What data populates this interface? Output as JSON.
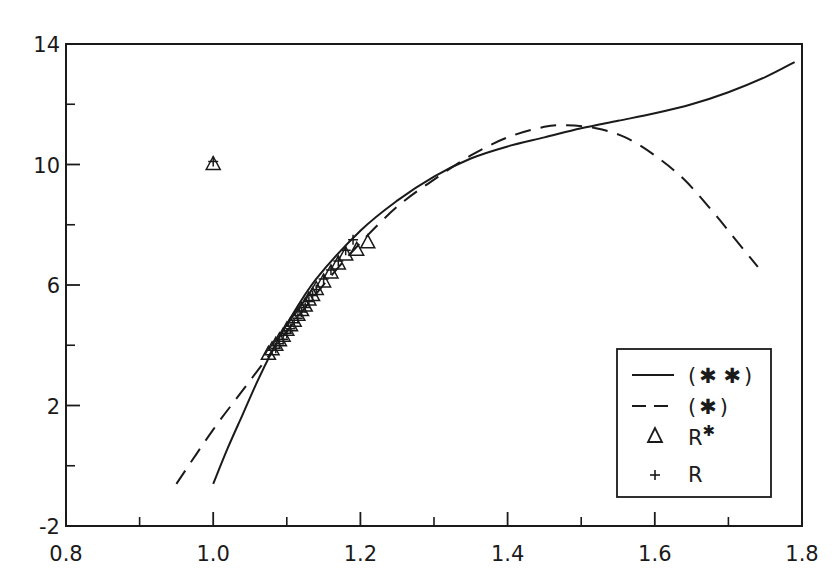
{
  "chart_data": {
    "type": "line",
    "title": "",
    "xlabel": "",
    "ylabel": "",
    "xlim": [
      0.8,
      1.8
    ],
    "ylim": [
      -2,
      14
    ],
    "grid": false,
    "legend_position": "lower right",
    "x_ticks_major": [
      0.8,
      1.0,
      1.2,
      1.4,
      1.6,
      1.8
    ],
    "x_tick_labels": [
      "0.8",
      "1.0",
      "1.2",
      "1.4",
      "1.6",
      "1.8"
    ],
    "x_ticks_minor": [
      0.9,
      1.1,
      1.3,
      1.5,
      1.7
    ],
    "y_ticks_major": [
      -2,
      2,
      6,
      10,
      14
    ],
    "y_tick_labels": [
      "-2",
      "2",
      "6",
      "10",
      "14"
    ],
    "y_ticks_minor": [
      0,
      4,
      8,
      12
    ],
    "series": [
      {
        "name": "(✱✱)",
        "style": "solid",
        "x": [
          1.0,
          1.02,
          1.04,
          1.06,
          1.08,
          1.1,
          1.14,
          1.2,
          1.25,
          1.3,
          1.35,
          1.4,
          1.45,
          1.5,
          1.55,
          1.6,
          1.65,
          1.7,
          1.75,
          1.79
        ],
        "y": [
          -0.6,
          0.6,
          1.7,
          2.8,
          3.8,
          4.7,
          6.2,
          7.8,
          8.8,
          9.6,
          10.2,
          10.6,
          10.9,
          11.2,
          11.45,
          11.7,
          12.0,
          12.4,
          12.9,
          13.4
        ]
      },
      {
        "name": "(✱)",
        "style": "dashed",
        "x": [
          0.95,
          1.0,
          1.04,
          1.08,
          1.12,
          1.16,
          1.2,
          1.25,
          1.3,
          1.35,
          1.4,
          1.45,
          1.48,
          1.52,
          1.56,
          1.6,
          1.64,
          1.68,
          1.71,
          1.74
        ],
        "y": [
          -0.6,
          1.2,
          2.5,
          3.8,
          5.1,
          6.3,
          7.4,
          8.6,
          9.5,
          10.3,
          10.9,
          11.25,
          11.3,
          11.2,
          10.9,
          10.3,
          9.5,
          8.4,
          7.5,
          6.6
        ]
      },
      {
        "name": "R✱",
        "style": "triangle-markers",
        "x": [
          1.0,
          1.075,
          1.08,
          1.085,
          1.09,
          1.095,
          1.1,
          1.105,
          1.11,
          1.115,
          1.12,
          1.125,
          1.13,
          1.135,
          1.14,
          1.15,
          1.16,
          1.17,
          1.18,
          1.195,
          1.21
        ],
        "y": [
          10.0,
          3.7,
          3.85,
          4.0,
          4.15,
          4.3,
          4.5,
          4.65,
          4.8,
          5.0,
          5.15,
          5.3,
          5.5,
          5.65,
          5.85,
          6.1,
          6.4,
          6.7,
          7.0,
          7.15,
          7.4
        ]
      },
      {
        "name": "R",
        "style": "plus-markers",
        "x": [
          1.0,
          1.085,
          1.09,
          1.095,
          1.1,
          1.105,
          1.11,
          1.115,
          1.12,
          1.125,
          1.13,
          1.135,
          1.14,
          1.15,
          1.16,
          1.17,
          1.18,
          1.19
        ],
        "y": [
          10.1,
          3.9,
          4.05,
          4.2,
          4.4,
          4.55,
          4.75,
          4.9,
          5.1,
          5.25,
          5.45,
          5.65,
          5.85,
          6.2,
          6.5,
          6.8,
          7.15,
          7.5
        ]
      }
    ],
    "legend": [
      {
        "label": "(✱✱)",
        "symbol": "solid-line"
      },
      {
        "label": "(✱)",
        "symbol": "dashed-line"
      },
      {
        "label": "R✱",
        "symbol": "triangle"
      },
      {
        "label": "R",
        "symbol": "plus"
      }
    ]
  },
  "legend": {
    "items": [
      {
        "prefix": "(",
        "stars": "✱ ✱",
        "suffix": ")"
      },
      {
        "prefix": "(",
        "stars": "✱",
        "suffix": ")"
      },
      {
        "base": "R",
        "sup": "✱"
      },
      {
        "base": "R"
      }
    ]
  },
  "style": {
    "ink": "#1a1a1a",
    "background": "#ffffff"
  }
}
